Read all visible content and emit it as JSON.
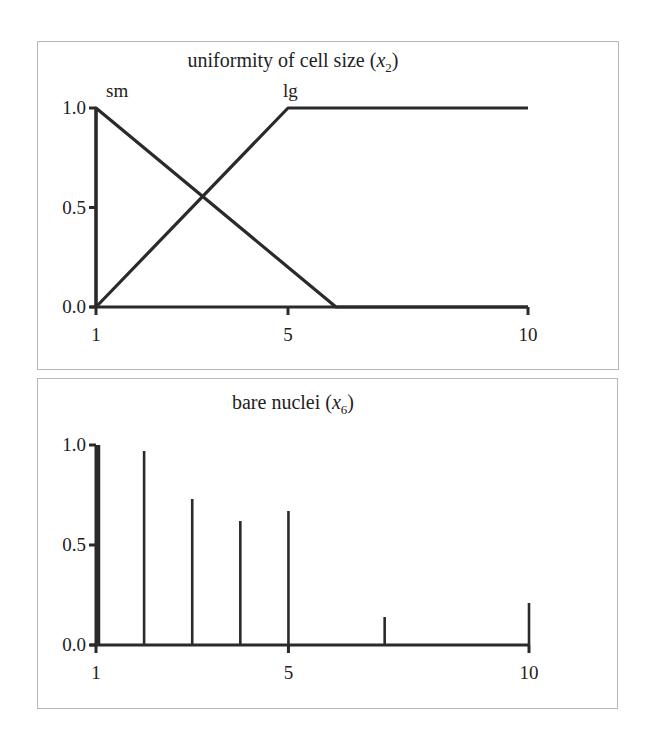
{
  "chart_data": [
    {
      "type": "line",
      "title": "uniformity of cell size (x2)",
      "title_parts": {
        "prefix": "uniformity of cell size (",
        "var": "x",
        "sub": "2",
        "suffix": ")"
      },
      "xlabel": "",
      "ylabel": "",
      "xlim": [
        1,
        10
      ],
      "ylim": [
        0,
        1
      ],
      "xticks": [
        "1",
        "5",
        "10"
      ],
      "yticks": [
        "0.0",
        "0.5",
        "1.0"
      ],
      "grid": false,
      "legend": "none",
      "series": [
        {
          "name": "sm",
          "x": [
            1,
            1,
            6,
            10
          ],
          "y": [
            0,
            1,
            0,
            0
          ]
        },
        {
          "name": "lg",
          "x": [
            1,
            5,
            10
          ],
          "y": [
            0,
            1,
            1
          ]
        }
      ],
      "annotations": [
        {
          "text": "sm",
          "x": 1,
          "y": 1
        },
        {
          "text": "lg",
          "x": 5,
          "y": 1
        }
      ]
    },
    {
      "type": "bar",
      "title": "bare nuclei (x6)",
      "title_parts": {
        "prefix": "bare nuclei (",
        "var": "x",
        "sub": "6",
        "suffix": ")"
      },
      "xlabel": "",
      "ylabel": "",
      "xlim": [
        1,
        10
      ],
      "ylim": [
        0,
        1
      ],
      "xticks": [
        "1",
        "5",
        "10"
      ],
      "yticks": [
        "0.0",
        "0.5",
        "1.0"
      ],
      "grid": false,
      "legend": "none",
      "categories": [
        1,
        2,
        3,
        4,
        5,
        6,
        7,
        8,
        9,
        10
      ],
      "values": [
        1.0,
        0.97,
        0.73,
        0.62,
        0.67,
        0.0,
        0.14,
        0.0,
        0.0,
        0.21
      ]
    }
  ]
}
